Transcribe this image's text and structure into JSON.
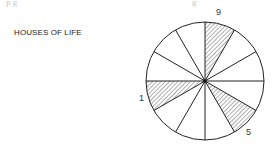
{
  "diagram": {
    "title": "HOUSES OF LIFE",
    "top_fragment_left": "p  g",
    "top_fragment_right": "g",
    "wheel": {
      "segments": 12,
      "hatched_houses": [
        {
          "label": "9",
          "start_deg": 0,
          "end_deg": 30
        },
        {
          "label": "5",
          "start_deg": 120,
          "end_deg": 150
        },
        {
          "label": "1",
          "start_deg": 240,
          "end_deg": 270
        }
      ]
    },
    "labels": {
      "house_9": "9",
      "house_5": "5",
      "house_1": "1"
    }
  }
}
